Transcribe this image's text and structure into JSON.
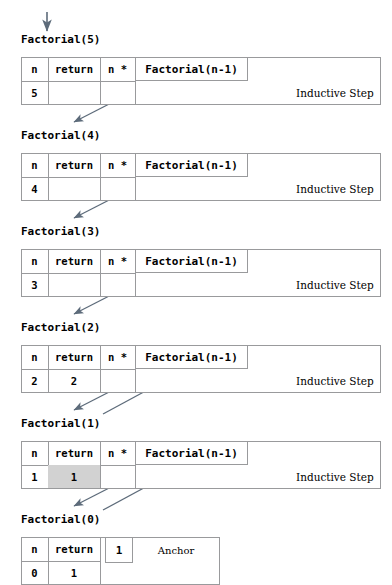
{
  "diagram": {
    "title_arrow": "down-arrow-entry",
    "columns": {
      "n_header": "n",
      "return_header": "return",
      "multiply": "n *"
    },
    "call_expression": "Factorial(n-1)",
    "inductive_label": "Inductive Step",
    "anchor_label": "Anchor",
    "anchor_value": "1",
    "shade_color": "#d2d2d2",
    "rule_color": "#999a9c",
    "arrow_color": "#5d6b7a",
    "blocks": [
      {
        "name": "Factorial(5)",
        "n": "5",
        "return": "",
        "multiply": "n *",
        "call": "Factorial(n-1)",
        "side": "Inductive Step",
        "kind": "inductive",
        "shaded_return": false
      },
      {
        "name": "Factorial(4)",
        "n": "4",
        "return": "",
        "multiply": "n *",
        "call": "Factorial(n-1)",
        "side": "Inductive Step",
        "kind": "inductive",
        "shaded_return": false
      },
      {
        "name": "Factorial(3)",
        "n": "3",
        "return": "",
        "multiply": "n *",
        "call": "Factorial(n-1)",
        "side": "Inductive Step",
        "kind": "inductive",
        "shaded_return": false
      },
      {
        "name": "Factorial(2)",
        "n": "2",
        "return": "2",
        "multiply": "n *",
        "call": "Factorial(n-1)",
        "side": "Inductive Step",
        "kind": "inductive",
        "shaded_return": false
      },
      {
        "name": "Factorial(1)",
        "n": "1",
        "return": "1",
        "multiply": "n *",
        "call": "Factorial(n-1)",
        "side": "Inductive Step",
        "kind": "inductive",
        "shaded_return": true
      },
      {
        "name": "Factorial(0)",
        "n": "0",
        "return": "1",
        "multiply": "",
        "call": "1",
        "side": "Anchor",
        "kind": "anchor",
        "shaded_return": false
      }
    ]
  }
}
